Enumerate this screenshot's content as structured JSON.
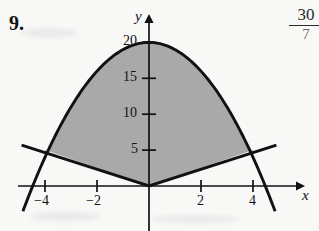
{
  "problem": {
    "number": "9."
  },
  "corner_note": {
    "numerator": "30",
    "denominator": "7"
  },
  "chart_data": {
    "type": "line",
    "title": "",
    "xlabel": "x",
    "ylabel": "y",
    "xlim": [
      -5.0,
      5.8
    ],
    "ylim": [
      -6.0,
      22.5
    ],
    "grid": false,
    "legend": false,
    "xticks": [
      -4,
      -2,
      2,
      4
    ],
    "xtick_labels": [
      "−4",
      "−2",
      "2",
      "4"
    ],
    "yticks": [
      5,
      10,
      15,
      20
    ],
    "ytick_labels": [
      "5",
      "10",
      "15",
      "20"
    ],
    "series": [
      {
        "name": "parabola",
        "equation": "y = 20 - x^2",
        "type": "curve",
        "color": "#111111",
        "x": [
          -4.85,
          -4.5,
          -4.0,
          -3.5,
          -3.0,
          -2.5,
          -2.0,
          -1.5,
          -1.0,
          -0.5,
          0.0,
          0.5,
          1.0,
          1.5,
          2.0,
          2.5,
          3.0,
          3.5,
          4.0,
          4.5,
          4.85
        ],
        "y": [
          -3.52,
          -0.25,
          4.0,
          7.75,
          11.0,
          13.75,
          16.0,
          17.75,
          19.0,
          19.75,
          20.0,
          19.75,
          19.0,
          17.75,
          16.0,
          13.75,
          11.0,
          7.75,
          4.0,
          -0.25,
          -3.52
        ]
      },
      {
        "name": "v-lines",
        "equation": "y = 1.25|x|",
        "type": "piecewise-linear",
        "color": "#111111",
        "x": [
          -4.9,
          0.0,
          4.9
        ],
        "y": [
          5.7,
          0.0,
          5.7
        ]
      }
    ],
    "shaded_region": {
      "label": "region between y = 1.25|x| and y = 20 - x^2",
      "fill": "#a9a9a9",
      "x_from": -4.0,
      "x_to": 4.0
    },
    "annotations": [
      {
        "text": "y",
        "at": [
          -0.35,
          21.5
        ]
      },
      {
        "text": "x",
        "at": [
          5.45,
          -1.1
        ]
      }
    ]
  },
  "axis_labels": {
    "x_axis": "x",
    "y_axis": "y"
  },
  "colors": {
    "ink": "#111111",
    "shade": "#a9a9a9",
    "paper": "#f8f8f7"
  }
}
